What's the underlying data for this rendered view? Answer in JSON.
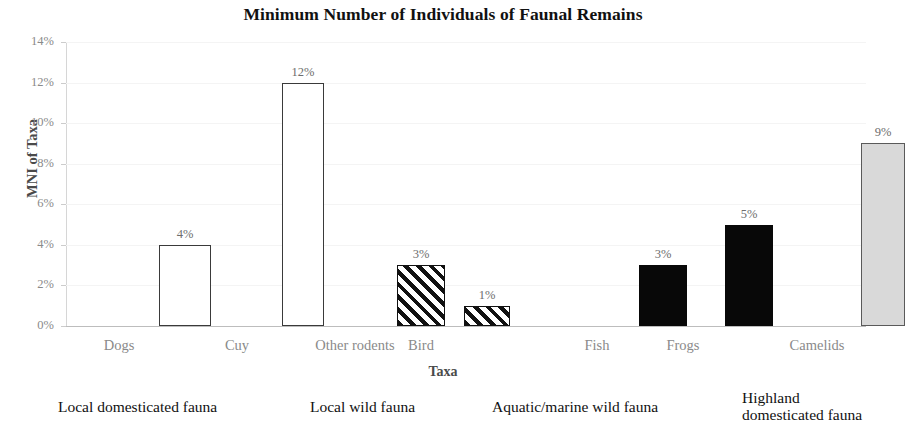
{
  "chart_data": {
    "type": "bar",
    "title": "Minimum Number of Individuals of Faunal Remains",
    "xlabel": "Taxa",
    "ylabel": "MNI of Taxa",
    "categories": [
      "Dogs",
      "Cuy",
      "Other rodents",
      "Bird",
      "Fish",
      "Frogs",
      "Camelids"
    ],
    "values": [
      4,
      12,
      3,
      1,
      3,
      5,
      9
    ],
    "value_labels": [
      "4%",
      "12%",
      "3%",
      "1%",
      "3%",
      "5%",
      "9%"
    ],
    "ylim": [
      0,
      14
    ],
    "ytick_labels": [
      "0%",
      "2%",
      "4%",
      "6%",
      "8%",
      "10%",
      "12%",
      "14%"
    ],
    "ytick_values": [
      0,
      2,
      4,
      6,
      8,
      10,
      12,
      14
    ],
    "grid": true,
    "legend": "none",
    "bar_styles": [
      "open",
      "open",
      "hatch",
      "hatch",
      "solid",
      "solid",
      "gray"
    ],
    "colors": {
      "open_fill": "#ffffff",
      "open_border": "#3a3a3a",
      "hatch_fill": "#111111",
      "solid_fill": "#080808",
      "gray_fill": "#d9d9d9",
      "gray_border": "#5a5a5a",
      "axis": "#bdbdbd",
      "tick_text": "#8a8a8a",
      "title_text": "#111111"
    },
    "group_captions": [
      "Local domesticated fauna",
      "Local wild fauna",
      "Aquatic/marine wild fauna",
      "Highland\ndomesticated fauna"
    ]
  }
}
